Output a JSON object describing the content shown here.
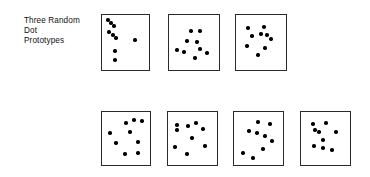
{
  "figure": {
    "background_color": "#ffffff",
    "dot_color": "#000000",
    "box_border_color": "#2b2b2b",
    "text_color": "#111111"
  },
  "captions": {
    "top": "Three Random\nDot\nPrototypes",
    "bottom": "Four Distortions\nof the Right\nPrototype\nAbove"
  },
  "rows": [
    {
      "name": "prototypes-row",
      "panels": [
        {
          "name": "prototype-1",
          "x": 101,
          "y": 14,
          "w": 49,
          "h": 57,
          "dots": [
            {
              "x": 6,
              "y": 5
            },
            {
              "x": 9,
              "y": 8
            },
            {
              "x": 12,
              "y": 11
            },
            {
              "x": 7,
              "y": 17
            },
            {
              "x": 11,
              "y": 20
            },
            {
              "x": 14,
              "y": 23
            },
            {
              "x": 33,
              "y": 25
            },
            {
              "x": 13,
              "y": 36
            },
            {
              "x": 13,
              "y": 45
            }
          ]
        },
        {
          "name": "prototype-2",
          "x": 168,
          "y": 14,
          "w": 52,
          "h": 57,
          "dots": [
            {
              "x": 22,
              "y": 16
            },
            {
              "x": 31,
              "y": 16
            },
            {
              "x": 18,
              "y": 26
            },
            {
              "x": 28,
              "y": 27
            },
            {
              "x": 8,
              "y": 35
            },
            {
              "x": 15,
              "y": 37
            },
            {
              "x": 31,
              "y": 34
            },
            {
              "x": 38,
              "y": 38
            },
            {
              "x": 26,
              "y": 43
            }
          ]
        },
        {
          "name": "prototype-3",
          "x": 235,
          "y": 14,
          "w": 52,
          "h": 57,
          "dots": [
            {
              "x": 12,
              "y": 13
            },
            {
              "x": 28,
              "y": 12
            },
            {
              "x": 16,
              "y": 21
            },
            {
              "x": 25,
              "y": 19
            },
            {
              "x": 31,
              "y": 20
            },
            {
              "x": 35,
              "y": 24
            },
            {
              "x": 11,
              "y": 31
            },
            {
              "x": 29,
              "y": 33
            },
            {
              "x": 22,
              "y": 40
            }
          ]
        }
      ]
    },
    {
      "name": "distortions-row",
      "panels": [
        {
          "name": "distortion-1",
          "x": 101,
          "y": 111,
          "w": 50,
          "h": 55,
          "dots": [
            {
              "x": 24,
              "y": 11
            },
            {
              "x": 32,
              "y": 8
            },
            {
              "x": 40,
              "y": 9
            },
            {
              "x": 28,
              "y": 20
            },
            {
              "x": 8,
              "y": 21
            },
            {
              "x": 14,
              "y": 31
            },
            {
              "x": 36,
              "y": 30
            },
            {
              "x": 23,
              "y": 42
            },
            {
              "x": 36,
              "y": 41
            }
          ]
        },
        {
          "name": "distortion-2",
          "x": 167,
          "y": 111,
          "w": 51,
          "h": 55,
          "dots": [
            {
              "x": 9,
              "y": 13
            },
            {
              "x": 9,
              "y": 18
            },
            {
              "x": 20,
              "y": 14
            },
            {
              "x": 28,
              "y": 11
            },
            {
              "x": 35,
              "y": 17
            },
            {
              "x": 24,
              "y": 26
            },
            {
              "x": 7,
              "y": 35
            },
            {
              "x": 37,
              "y": 34
            },
            {
              "x": 19,
              "y": 42
            }
          ]
        },
        {
          "name": "distortion-3",
          "x": 233,
          "y": 111,
          "w": 51,
          "h": 55,
          "dots": [
            {
              "x": 24,
              "y": 10
            },
            {
              "x": 36,
              "y": 12
            },
            {
              "x": 15,
              "y": 19
            },
            {
              "x": 23,
              "y": 21
            },
            {
              "x": 31,
              "y": 24
            },
            {
              "x": 38,
              "y": 29
            },
            {
              "x": 29,
              "y": 37
            },
            {
              "x": 9,
              "y": 41
            },
            {
              "x": 19,
              "y": 46
            }
          ]
        },
        {
          "name": "distortion-4",
          "x": 300,
          "y": 111,
          "w": 51,
          "h": 55,
          "dots": [
            {
              "x": 12,
              "y": 12
            },
            {
              "x": 25,
              "y": 11
            },
            {
              "x": 14,
              "y": 18
            },
            {
              "x": 18,
              "y": 20
            },
            {
              "x": 35,
              "y": 20
            },
            {
              "x": 22,
              "y": 28
            },
            {
              "x": 13,
              "y": 34
            },
            {
              "x": 22,
              "y": 36
            },
            {
              "x": 31,
              "y": 38
            }
          ]
        }
      ]
    }
  ]
}
